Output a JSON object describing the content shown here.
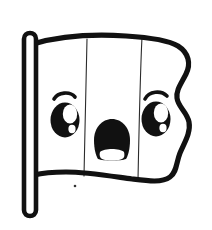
{
  "artwork": {
    "title": "Cute Cartoon Flag",
    "subject": "flag-with-face",
    "style": "black-and-white line art / coloring page",
    "caption": "Black outline drawing of a waving flag on a pole with a surprised kawaii face",
    "canvas": {
      "width": 212,
      "height": 230
    },
    "colors": {
      "background": "#ffffff",
      "ink": "#111111",
      "paper": "#ffffff",
      "divider": "#2b2b2b",
      "speck": "#333333"
    },
    "line": {
      "outline_weight": 5.2,
      "pole_weight": 4.6,
      "divider_weight": 1.1,
      "brow_weight": 3.6
    },
    "parts": [
      {
        "name": "flagpole",
        "label": "Flagpole",
        "shape": "rounded vertical bar",
        "x": 24,
        "y_top": 33,
        "y_bottom": 216,
        "width": 11
      },
      {
        "name": "flag-cloth",
        "label": "Flag cloth",
        "shape": "waving rectangle with S-curved right edge"
      },
      {
        "name": "stripe-divider-left",
        "label": "Left stripe divider",
        "x_top": 86,
        "x_bottom": 84
      },
      {
        "name": "stripe-divider-right",
        "label": "Right stripe divider",
        "x_top": 141,
        "x_bottom": 138
      },
      {
        "name": "left-eye",
        "label": "Left eye",
        "cx": 65,
        "cy": 119,
        "rx": 14,
        "ry": 17
      },
      {
        "name": "left-eye-highlight",
        "label": "Left eye highlight",
        "cx": 70,
        "cy": 113,
        "rx": 7,
        "ry": 9
      },
      {
        "name": "left-eyebrow",
        "label": "Left eyebrow",
        "cx": 64,
        "cy": 96
      },
      {
        "name": "right-eye",
        "label": "Right eye",
        "cx": 156,
        "cy": 118,
        "rx": 14,
        "ry": 17
      },
      {
        "name": "right-eye-highlight",
        "label": "Right eye highlight",
        "cx": 161,
        "cy": 112,
        "rx": 7,
        "ry": 9
      },
      {
        "name": "right-eyebrow",
        "label": "Right eyebrow",
        "cx": 156,
        "cy": 96
      },
      {
        "name": "mouth",
        "label": "Open mouth",
        "cx": 112,
        "cy": 139,
        "rx": 17,
        "ry": 20
      },
      {
        "name": "tongue",
        "label": "Lower lip / tongue",
        "cx": 112,
        "cy": 154,
        "rx": 11,
        "ry": 6
      },
      {
        "name": "speck",
        "label": "Stray ink speck",
        "cx": 75,
        "cy": 186,
        "r": 1.2
      }
    ],
    "stripes": [
      {
        "name": "stripe-left",
        "label": "Left stripe",
        "fill": "#ffffff"
      },
      {
        "name": "stripe-middle",
        "label": "Middle stripe",
        "fill": "#ffffff"
      },
      {
        "name": "stripe-right",
        "label": "Right stripe",
        "fill": "#ffffff"
      }
    ],
    "expression": {
      "name": "surprised",
      "label": "Surprised",
      "eyes": "wide open with highlight",
      "mouth": "open oval"
    }
  }
}
